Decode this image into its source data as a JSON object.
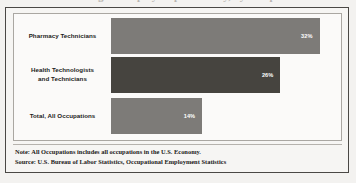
{
  "figure": {
    "title_remnant": "Percentage of employees paid hourly, by occupation",
    "note_line": "Note: All Occupations includes all occupations in the U.S. Economy.",
    "source_line": "Source: U.S. Bureau of Labor Statistics, Occupational Employment Statistics"
  },
  "chart_data": {
    "type": "bar",
    "orientation": "horizontal",
    "title": "",
    "xlabel": "",
    "ylabel": "",
    "grid": false,
    "legend": "none",
    "xlim": [
      0,
      35
    ],
    "categories": [
      "Pharmacy Technicians",
      "Health Technologists and Technicians",
      "Total, All Occupations"
    ],
    "values": [
      32,
      26,
      14
    ],
    "value_labels": [
      "32%",
      "26%",
      "14%"
    ],
    "bar_colors": [
      "#7d7b78",
      "#46443f",
      "#7d7b78"
    ],
    "label_lines": [
      [
        "Pharmacy Technicians"
      ],
      [
        "Health Technologists",
        "and Technicians"
      ],
      [
        "Total, All Occupations"
      ]
    ]
  }
}
